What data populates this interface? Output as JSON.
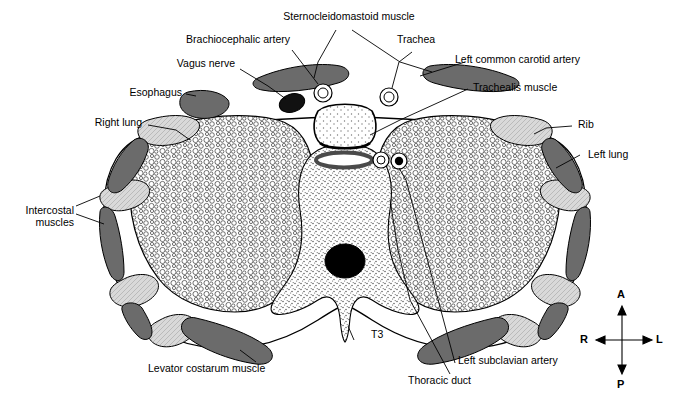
{
  "figure": {
    "type": "anatomical-cross-section-diagram"
  },
  "labels": [
    {
      "id": "sternocleidomastoid",
      "text": "Sternocleidomastoid muscle"
    },
    {
      "id": "brachiocephalic-artery",
      "text": "Brachiocephalic artery"
    },
    {
      "id": "trachea",
      "text": "Trachea"
    },
    {
      "id": "left-common-carotid-artery",
      "text": "Left common carotid artery"
    },
    {
      "id": "vagus-nerve",
      "text": "Vagus nerve"
    },
    {
      "id": "trachealis-muscle",
      "text": "Trachealis muscle"
    },
    {
      "id": "esophagus",
      "text": "Esophagus"
    },
    {
      "id": "right-lung",
      "text": "Right lung"
    },
    {
      "id": "rib",
      "text": "Rib"
    },
    {
      "id": "left-lung",
      "text": "Left lung"
    },
    {
      "id": "intercostal-muscles",
      "text": "Intercostal\nmuscles"
    },
    {
      "id": "levator-costarum-muscle",
      "text": "Levator costarum muscle"
    },
    {
      "id": "t3",
      "text": "T3"
    },
    {
      "id": "left-subclavian-artery",
      "text": "Left subclavian artery"
    },
    {
      "id": "thoracic-duct",
      "text": "Thoracic duct"
    }
  ],
  "compass": {
    "anterior": "A",
    "posterior": "P",
    "right": "R",
    "left": "L"
  },
  "colors": {
    "outline": "#000000",
    "muscle_fill": "#6b6b6b",
    "bone_fill": "#d8d8d8",
    "lung_fill": "#ffffff",
    "background": "#ffffff",
    "vessel_dark": "#111111"
  }
}
